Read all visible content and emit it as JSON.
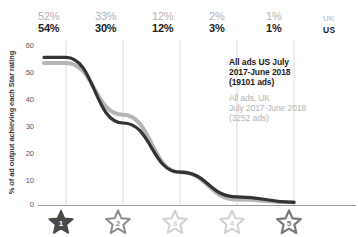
{
  "chart_data": {
    "type": "line",
    "title": "",
    "xlabel": "",
    "ylabel": "% of ad output achieving each Star rating",
    "categories": [
      "1 Star",
      "2 Star",
      "3 Star",
      "4 Star",
      "5 Star"
    ],
    "ylim": [
      0,
      60
    ],
    "yticks": [
      0,
      10,
      20,
      30,
      40,
      50,
      60
    ],
    "grid": "vertical",
    "legend_position": "inside-right",
    "series": [
      {
        "name": "All ads US July 2017-June 2018 (19101 ads)",
        "short_name": "US",
        "color": "#333333",
        "values": [
          54,
          30,
          12,
          3,
          1
        ],
        "data_labels": [
          "54%",
          "30%",
          "12%",
          "3%",
          "1%"
        ]
      },
      {
        "name": "All ads, UK July 2017-June 2018 (3252 ads)",
        "short_name": "UK",
        "color": "#b5b5b5",
        "values": [
          52,
          33,
          12,
          2,
          1
        ],
        "data_labels": [
          "52%",
          "33%",
          "12%",
          "2%",
          "1%"
        ]
      }
    ]
  },
  "top_labels": {
    "uk_row": [
      "52%",
      "33%",
      "12%",
      "2%",
      "1%"
    ],
    "uk_tag": "UK",
    "us_row": [
      "54%",
      "30%",
      "12%",
      "3%",
      "1%"
    ],
    "us_tag": "US"
  },
  "y_axis": {
    "title": "% of ad output achieving each Star rating",
    "ticks": [
      "60",
      "50",
      "40",
      "30",
      "20",
      "10",
      "0"
    ]
  },
  "legend": {
    "us": {
      "line1": "All ads US July",
      "line2": "2017-June 2018",
      "line3": "(19101 ads)"
    },
    "uk": {
      "line1": "All ads, UK",
      "line2": "July 2017-June 2018",
      "line3": "(3252 ads)"
    }
  },
  "x_axis": {
    "stars": [
      {
        "label": "1",
        "filled": true,
        "color": "#4a4a4a"
      },
      {
        "label": "2",
        "filled": false,
        "color": "#8c8c8c"
      },
      {
        "label": "3",
        "filled": false,
        "color": "#cfcfcf"
      },
      {
        "label": "4",
        "filled": false,
        "color": "#cfcfcf"
      },
      {
        "label": "5",
        "filled": false,
        "color": "#7a7a7a"
      }
    ]
  },
  "colors": {
    "us_series": "#333333",
    "uk_series": "#b5b5b5",
    "grid": "#d8d8d8",
    "axis": "#9a9a9a"
  }
}
